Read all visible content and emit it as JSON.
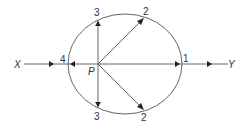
{
  "diagram": {
    "type": "ray-diagram",
    "colors": {
      "line": "#555555",
      "arrow": "#222222",
      "text": "#333333",
      "background": "#ffffff"
    },
    "axis": {
      "start_label": "X",
      "end_label": "Y"
    },
    "center_point": {
      "label": "P"
    },
    "boundary": {
      "shape": "ellipse"
    },
    "points": [
      {
        "id": "1",
        "label": "1",
        "position": "right"
      },
      {
        "id": "2-upper",
        "label": "2",
        "position": "upper-right"
      },
      {
        "id": "2-lower",
        "label": "2",
        "position": "lower-right"
      },
      {
        "id": "3-upper",
        "label": "3",
        "position": "top"
      },
      {
        "id": "3-lower",
        "label": "3",
        "position": "bottom"
      },
      {
        "id": "4",
        "label": "4",
        "position": "left"
      }
    ]
  }
}
